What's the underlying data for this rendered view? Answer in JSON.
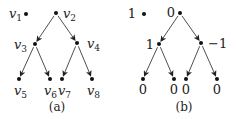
{
  "diagrams": [
    {
      "caption": "(a)",
      "nodes": [
        {
          "id": "v1",
          "label_base": "v",
          "label_sub": "1"
        },
        {
          "id": "v2",
          "label_base": "v",
          "label_sub": "2"
        },
        {
          "id": "v3",
          "label_base": "v",
          "label_sub": "3"
        },
        {
          "id": "v4",
          "label_base": "v",
          "label_sub": "4"
        },
        {
          "id": "v5",
          "label_base": "v",
          "label_sub": "5"
        },
        {
          "id": "v6",
          "label_base": "v",
          "label_sub": "6"
        },
        {
          "id": "v7",
          "label_base": "v",
          "label_sub": "7"
        },
        {
          "id": "v8",
          "label_base": "v",
          "label_sub": "8"
        }
      ],
      "edges": [
        [
          "v2",
          "v3"
        ],
        [
          "v2",
          "v4"
        ],
        [
          "v3",
          "v5"
        ],
        [
          "v3",
          "v6"
        ],
        [
          "v4",
          "v7"
        ],
        [
          "v4",
          "v8"
        ]
      ]
    },
    {
      "caption": "(b)",
      "nodes": [
        {
          "id": "b1",
          "label": "1"
        },
        {
          "id": "b2",
          "label": "0"
        },
        {
          "id": "b3",
          "label": "1"
        },
        {
          "id": "b4",
          "label": "−1"
        },
        {
          "id": "b5",
          "label": "0"
        },
        {
          "id": "b6",
          "label": "0"
        },
        {
          "id": "b7",
          "label": "0"
        },
        {
          "id": "b8",
          "label": "0"
        }
      ],
      "edges": [
        [
          "b2",
          "b3"
        ],
        [
          "b2",
          "b4"
        ],
        [
          "b3",
          "b5"
        ],
        [
          "b3",
          "b6"
        ],
        [
          "b4",
          "b7"
        ],
        [
          "b4",
          "b8"
        ]
      ]
    }
  ]
}
